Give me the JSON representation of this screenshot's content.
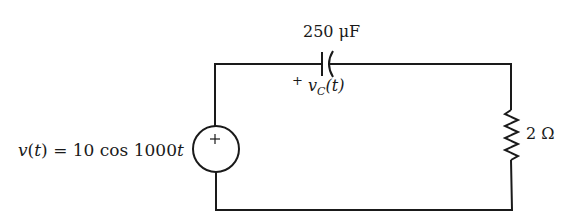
{
  "diagram": {
    "type": "circuit",
    "components": {
      "source": {
        "kind": "ac-voltage-source",
        "label": "v(t) = 10 cos 1000t",
        "label_parts": {
          "lhs": "v",
          "arg_open": "(",
          "arg": "t",
          "arg_close": ")",
          "eq": " = 10 cos 1000",
          "var": "t"
        },
        "polarity_mark": "+"
      },
      "capacitor": {
        "kind": "capacitor",
        "value_label": "250 μF",
        "voltage_label": {
          "plus": "+",
          "symbol": "v",
          "subscript": "C",
          "arg": "(t)"
        }
      },
      "resistor": {
        "kind": "resistor",
        "value_label": "2 Ω"
      }
    },
    "colors": {
      "stroke": "#1a1a1a",
      "background": "#ffffff"
    }
  }
}
